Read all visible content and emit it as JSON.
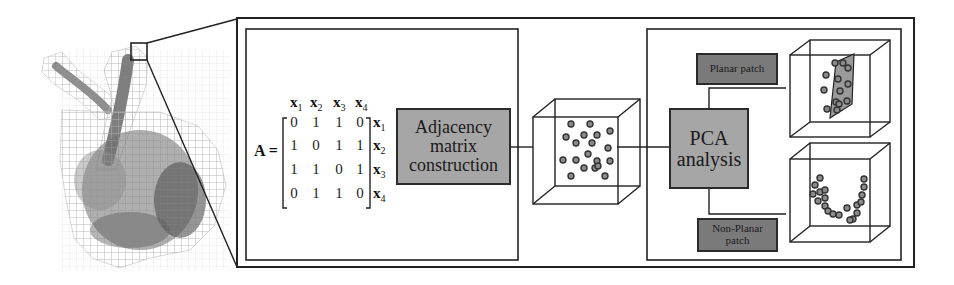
{
  "matrix": {
    "lhs": "A =",
    "var_prefix": "x",
    "column_labels": [
      "1",
      "2",
      "3",
      "4"
    ],
    "row_labels": [
      "1",
      "2",
      "3",
      "4"
    ],
    "rows": [
      [
        "0",
        "1",
        "1",
        "0"
      ],
      [
        "1",
        "0",
        "1",
        "1"
      ],
      [
        "1",
        "1",
        "0",
        "1"
      ],
      [
        "0",
        "1",
        "1",
        "0"
      ]
    ]
  },
  "boxes": {
    "adjacency": {
      "line1": "Adjacency",
      "line2": "matrix",
      "line3": "construction"
    },
    "pca": {
      "line1": "PCA",
      "line2": "analysis"
    },
    "planar": {
      "label": "Planar patch"
    },
    "nonplanar": {
      "line1": "Non-Planar",
      "line2": "patch"
    }
  },
  "colors": {
    "line": "#222222",
    "box_dark": "#7a7a7a",
    "box_mid": "#a6a6a6",
    "plane_fill": "#9a9a9a",
    "point_stroke": "#333333",
    "voxel_grid": "#b0b0b0",
    "bunny": "#6e6e6e"
  },
  "points": {
    "cube_scatter": [
      [
        571,
        124
      ],
      [
        590,
        124
      ],
      [
        566,
        137
      ],
      [
        584,
        135
      ],
      [
        597,
        135
      ],
      [
        610,
        131
      ],
      [
        576,
        143
      ],
      [
        592,
        143
      ],
      [
        608,
        148
      ],
      [
        588,
        154
      ],
      [
        563,
        160
      ],
      [
        576,
        160
      ],
      [
        597,
        161
      ],
      [
        610,
        161
      ],
      [
        584,
        168
      ],
      [
        595,
        168
      ],
      [
        571,
        176
      ],
      [
        605,
        176
      ],
      [
        598,
        166
      ]
    ],
    "planar": [
      [
        835,
        63
      ],
      [
        843,
        63
      ],
      [
        848,
        68
      ],
      [
        826,
        75
      ],
      [
        838,
        79
      ],
      [
        848,
        84
      ],
      [
        824,
        90
      ],
      [
        840,
        91
      ],
      [
        836,
        102
      ],
      [
        847,
        101
      ],
      [
        827,
        109
      ],
      [
        839,
        104
      ],
      [
        837,
        110
      ]
    ],
    "nonplanar": [
      [
        820,
        178
      ],
      [
        815,
        185
      ],
      [
        813,
        194
      ],
      [
        820,
        192
      ],
      [
        825,
        190
      ],
      [
        825,
        198
      ],
      [
        818,
        201
      ],
      [
        825,
        206
      ],
      [
        828,
        211
      ],
      [
        833,
        214
      ],
      [
        839,
        215
      ],
      [
        847,
        208
      ],
      [
        853,
        219
      ],
      [
        850,
        220
      ],
      [
        857,
        213
      ],
      [
        857,
        205
      ],
      [
        861,
        202
      ],
      [
        862,
        195
      ],
      [
        864,
        187
      ],
      [
        864,
        179
      ]
    ]
  }
}
